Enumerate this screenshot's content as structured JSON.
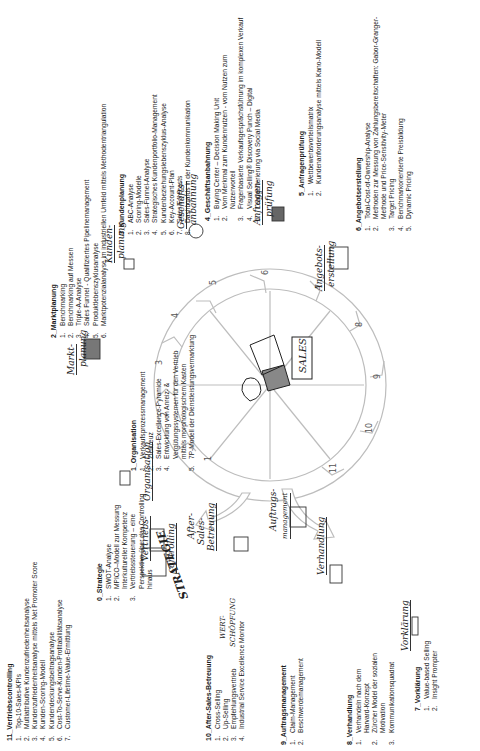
{
  "center_label": "SALES",
  "wheel_numbers": [
    "1",
    "2",
    "3",
    "4",
    "5",
    "6",
    "7",
    "8",
    "9",
    "10",
    "11"
  ],
  "handwritten_labels": {
    "strategie": "STRATEGIE",
    "wertschoepfung_1": "WERT-",
    "wertschoepfung_2": "SCHÖPFUNG",
    "organisation": "Organisation",
    "marktplanung_1": "Markt-",
    "marktplanung_2": "planung",
    "kundenplanung_1": "Kunden-",
    "kundenplanung_2": "planung",
    "geschaeftsanbahnung_1": "Geschäfts-",
    "geschaeftsanbahnung_2": "anbahnung",
    "anfragenpruefung_1": "Anfragen-",
    "anfragenpruefung_2": "prüfung",
    "angebotserstellung_1": "Angebots-",
    "angebotserstellung_2": "erstellung",
    "vorklaerung": "Vorklärung",
    "verhandlung": "Verhandlung",
    "auftragsmanagement_1": "Auftrags-",
    "auftragsmanagement_2": "management",
    "aftersales_1": "After-",
    "aftersales_2": "Sales-",
    "aftersales_3": "Betreuung",
    "vertriebscontrolling_1": "Vertriebs-",
    "vertriebscontrolling_2": "controlling"
  },
  "sections": {
    "s0": {
      "title": "0_Strategie",
      "items": [
        {
          "n": "1.",
          "t": "SWOT-Analyse"
        },
        {
          "n": "2.",
          "t": "MPICO–Modell zur Messung Interkultureller Kompetenz"
        },
        {
          "n": "3.",
          "t": "Vertriebssteuerung – eine Perspektive über das Controlling hinaus"
        }
      ]
    },
    "s1": {
      "title": "1_Organisation",
      "items": [
        {
          "n": "1.",
          "t": "Verkaufsprozessmanagement"
        },
        {
          "n": "2.",
          "t": "Zielkreuz"
        },
        {
          "n": "3.",
          "t": "Sales-Excellence-Pyramide"
        },
        {
          "n": "4.",
          "t": "Entwicklung von Anreiz- & Vergütungssystemen für den Vertrieb mittels morphologischem Kasten"
        },
        {
          "n": "5.",
          "t": "7P-Modell der Dienstleistungsvermarktung"
        }
      ]
    },
    "s2": {
      "title": "2_Marktplanung",
      "items": [
        {
          "n": "1.",
          "t": "Benchmarking"
        },
        {
          "n": "2.",
          "t": "Benchmarking auf Messen"
        },
        {
          "n": "3.",
          "t": "Triple-A-Analyse"
        },
        {
          "n": "4.",
          "t": "Sales Funnel - Qualifiziertes Pipelinemanagement"
        },
        {
          "n": "5.",
          "t": "Produktlebenszyklusanalyse"
        },
        {
          "n": "6.",
          "t": "Marktpotenzialanalyse im industriellen Umfeld mittels Methodentriangulation"
        }
      ]
    },
    "s3": {
      "title": "3_Kundenplanung",
      "items": [
        {
          "n": "1.",
          "t": "ABC-Analyse"
        },
        {
          "n": "2.",
          "t": "Scoring-Modelle"
        },
        {
          "n": "3.",
          "t": "Sales-Funnel-Analyse"
        },
        {
          "n": "4.",
          "t": "Strategisches Kundenportfolio-Management"
        },
        {
          "n": "5.",
          "t": "Kundenbeziehungslebenszyklus-Analyse"
        },
        {
          "n": "6.",
          "t": "Key-Account-Plan"
        },
        {
          "n": "7.",
          "t": "Sales Forecasts"
        },
        {
          "n": "8.",
          "t": "Dashboards in der Kundenkommunikation"
        }
      ]
    },
    "s4": {
      "title": "4_Geschäftsanbahnung",
      "items": [
        {
          "n": "1.",
          "t": "Buying Center – Decision Making Unit"
        },
        {
          "n": "2.",
          "t": "Vom Merkmal zum Kundennutzen - vom Nutzen zum Nutzenvorteil"
        },
        {
          "n": "3.",
          "t": "Fragenbasierte Verkaufsgesprächsführung im komplexen Verkauf"
        },
        {
          "n": "4.",
          "t": "Visual Selling® Discovery Punch – Digital"
        },
        {
          "n": "5.",
          "t": "Leadgenerierung via Social Media"
        }
      ]
    },
    "s5": {
      "title": "5_Anfragenprüfung",
      "items": [
        {
          "n": "1.",
          "t": "Wettbewerbsvorteilsmatrix"
        },
        {
          "n": "2.",
          "t": "Kundenanforderungsanalyse mittels Kano-Modell"
        }
      ]
    },
    "s6": {
      "title": "6_Angebotserstellung",
      "items": [
        {
          "n": "1.",
          "t": "Total-Cost-of-Ownership-Analyse"
        },
        {
          "n": "2.",
          "t": "Methoden zur Messung von Zahlungsbereitschaften: Gabor-Granger-Methode und Price-Sensitivity-Meter"
        },
        {
          "n": "3.",
          "t": "Target Pricing"
        },
        {
          "n": "4.",
          "t": "Benchmarkorientierte Preisbildung"
        },
        {
          "n": "5.",
          "t": "Dynamic Pricing"
        }
      ]
    },
    "s7": {
      "title": "7_Vorklärung",
      "items": [
        {
          "n": "1.",
          "t": "Value-based Selling"
        },
        {
          "n": "2.",
          "t": "Insight Prompter"
        }
      ]
    },
    "s8": {
      "title": "8_Verhandlung",
      "items": [
        {
          "n": "1.",
          "t": "Verhandeln nach dem Harvard-Konzept"
        },
        {
          "n": "2.",
          "t": "Zürcher Model der sozialen Motivation"
        },
        {
          "n": "3.",
          "t": "Kommunikationsquadrat"
        }
      ]
    },
    "s9": {
      "title": "9_Auftragsmanagement",
      "items": [
        {
          "n": "1.",
          "t": "Claim-Management"
        },
        {
          "n": "2.",
          "t": "Beschwerdemanagement"
        }
      ]
    },
    "s10": {
      "title": "10_After-Sales-Betreuung",
      "items": [
        {
          "n": "1.",
          "t": "Cross-Selling"
        },
        {
          "n": "2.",
          "t": "Up-Selling"
        },
        {
          "n": "3.",
          "t": "Empfehlungsvertrieb"
        },
        {
          "n": "4.",
          "t": "Industrial Service Excellence Monitor"
        }
      ]
    },
    "s11": {
      "title": "11_Vertriebscontrolling",
      "items": [
        {
          "n": "1.",
          "t": "Top-10-Sales-KPIs"
        },
        {
          "n": "2.",
          "t": "Multiattributive Kundenzufriedenheitsanalyse"
        },
        {
          "n": "3.",
          "t": "Kundenzufriedenheitsanalyse mittels Net Promoter Score"
        },
        {
          "n": "4.",
          "t": "Kunden-Scoring-Modell"
        },
        {
          "n": "5.",
          "t": "Kundendeckungsbeitragsanalyse"
        },
        {
          "n": "6.",
          "t": "Cost-To-Serve-Kunden-Profitabilitätsanalyse"
        },
        {
          "n": "7.",
          "t": "Customer-Lifetime-Value-Ermittlung"
        }
      ]
    }
  }
}
